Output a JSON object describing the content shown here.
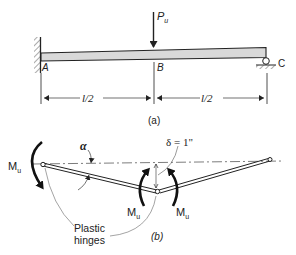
{
  "figure_a": {
    "caption": "(a)",
    "load": {
      "symbol": "P",
      "subscript": "u"
    },
    "points": {
      "A": "A",
      "B": "B",
      "C": "C"
    },
    "dimensions": {
      "left_span": "l/2",
      "right_span": "l/2"
    },
    "supports": {
      "left": "fixed-wall",
      "right": "roller"
    }
  },
  "figure_b": {
    "caption": "(b)",
    "angle_label": "α",
    "deflection_label": "δ = 1\"",
    "moment_labels": {
      "left": {
        "symbol": "M",
        "subscript": "u"
      },
      "center_left": {
        "symbol": "M",
        "subscript": "u"
      },
      "center_right": {
        "symbol": "M",
        "subscript": "u"
      }
    },
    "note_line1": "Plastic",
    "note_line2": "hinges"
  },
  "colors": {
    "ink": "#222222",
    "beam_fill": "#d9d9d9",
    "background": "#ffffff"
  }
}
